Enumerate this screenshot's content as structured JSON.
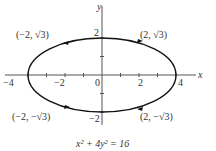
{
  "diagram": {
    "type": "ellipse-graph",
    "equation": "x² + 4y² = 16",
    "axes": {
      "x_label": "x",
      "y_label": "y"
    },
    "x_ticks": [
      {
        "value": -4,
        "label": "−4"
      },
      {
        "value": -2,
        "label": "−2"
      },
      {
        "value": 0,
        "label": "0"
      },
      {
        "value": 2,
        "label": "2"
      },
      {
        "value": 4,
        "label": "4"
      }
    ],
    "y_ticks": [
      {
        "value": 2,
        "label": "2"
      },
      {
        "value": -2,
        "label": "−2"
      }
    ],
    "points": [
      {
        "label": "(−2, √3)",
        "x": -2,
        "y": 1.732
      },
      {
        "label": "(2, √3)",
        "x": 2,
        "y": 1.732
      },
      {
        "label": "(−2, −√3)",
        "x": -2,
        "y": -1.732
      },
      {
        "label": "(2, −√3)",
        "x": 2,
        "y": -1.732
      }
    ],
    "colors": {
      "curve": "#111111",
      "axis": "#444444",
      "text": "#333333"
    }
  }
}
